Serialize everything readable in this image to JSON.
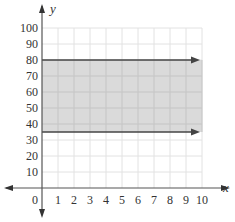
{
  "chart_data": {
    "type": "area",
    "title": "",
    "xlabel": "x",
    "ylabel": "y",
    "xlim": [
      0,
      10
    ],
    "ylim": [
      0,
      100
    ],
    "x_ticks": [
      0,
      1,
      2,
      3,
      4,
      5,
      6,
      7,
      8,
      9,
      10
    ],
    "y_ticks": [
      10,
      20,
      30,
      40,
      50,
      60,
      70,
      80,
      90,
      100
    ],
    "grid": true,
    "legend": "none",
    "series": [
      {
        "name": "upper boundary",
        "type": "line",
        "x": [
          0,
          10
        ],
        "values": [
          80,
          80
        ],
        "arrow": "right",
        "color": "#444444"
      },
      {
        "name": "lower boundary",
        "type": "line",
        "x": [
          0,
          10
        ],
        "values": [
          35,
          35
        ],
        "arrow": "right",
        "color": "#444444"
      }
    ],
    "shaded_region": {
      "x": [
        0,
        10
      ],
      "y_low": 35,
      "y_high": 80,
      "color": "#d4d4d4"
    }
  },
  "colors": {
    "shade": "#d4d4d4",
    "grid": "#e2e2e2",
    "axis": "#555555",
    "line": "#444444"
  }
}
